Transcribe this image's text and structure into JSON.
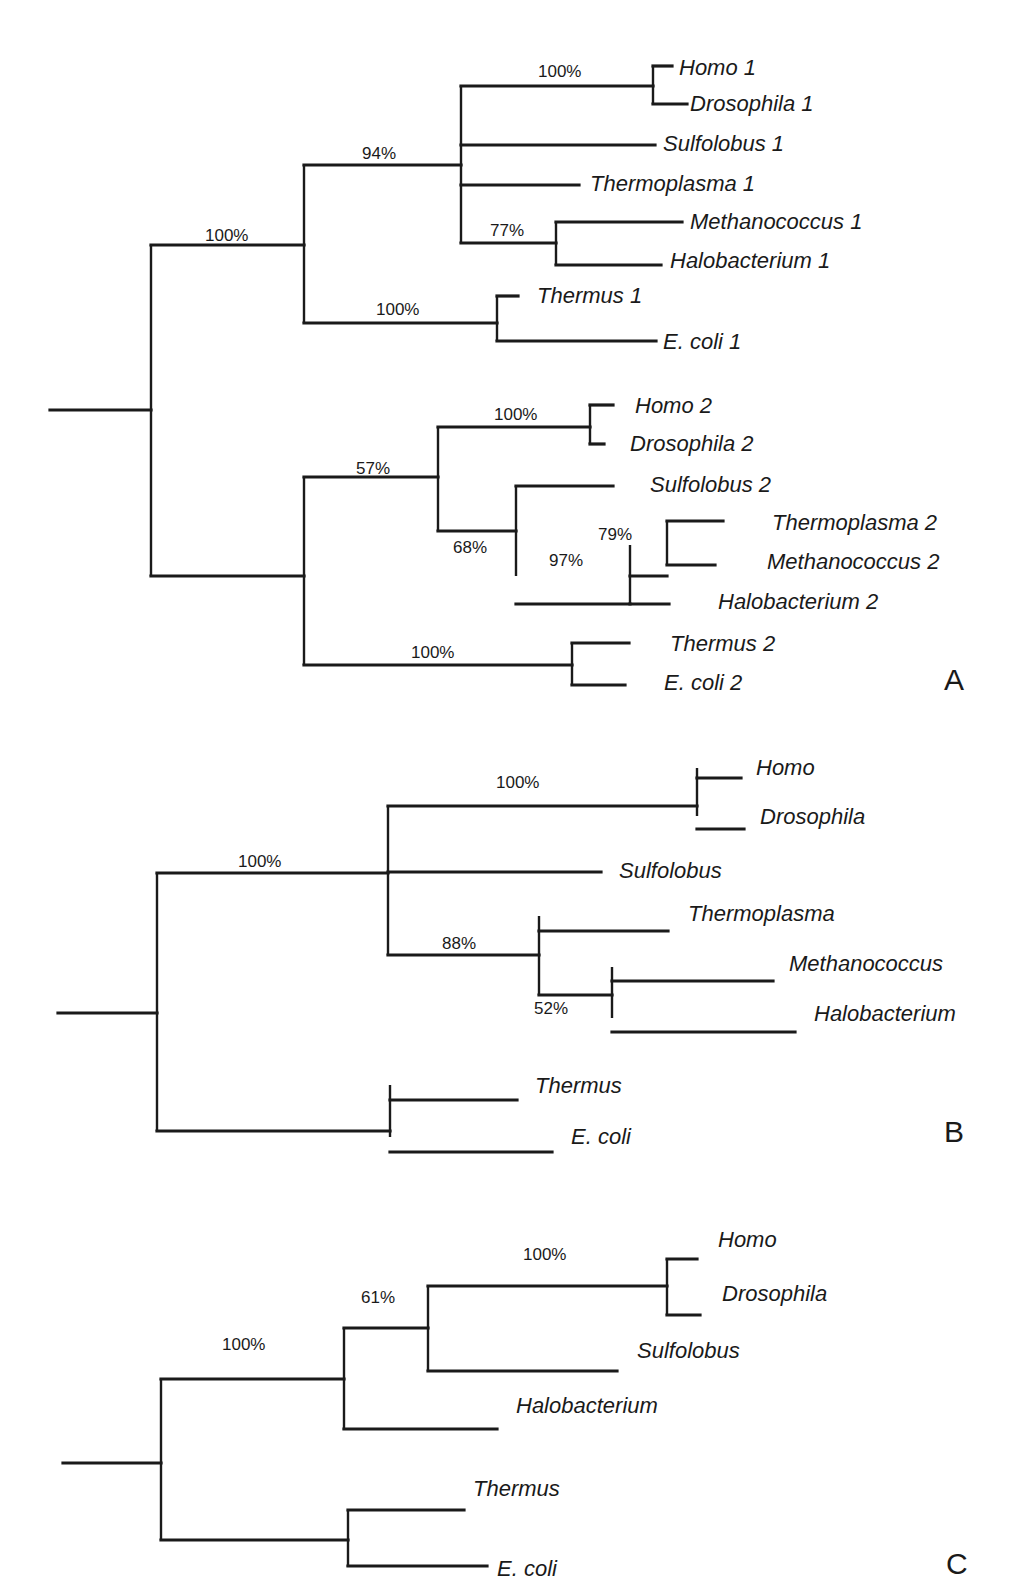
{
  "figure": {
    "panels": [
      {
        "id": "A",
        "letter": "A",
        "letter_pos": [
          944,
          690
        ],
        "vlines": [
          [
            151,
            245,
            576
          ],
          [
            304,
            165,
            323
          ],
          [
            461,
            86,
            243
          ],
          [
            653,
            66,
            104
          ],
          [
            556,
            222,
            265
          ],
          [
            497,
            296,
            341
          ],
          [
            304,
            477,
            665
          ],
          [
            438,
            427,
            531
          ],
          [
            590,
            405,
            444
          ],
          [
            516,
            486,
            576
          ],
          [
            630,
            545,
            604
          ],
          [
            667,
            521,
            565
          ],
          [
            572,
            643,
            685
          ]
        ],
        "hlines": [
          [
            50,
            151,
            410
          ],
          [
            151,
            304,
            245
          ],
          [
            151,
            304,
            576
          ],
          [
            304,
            461,
            165
          ],
          [
            304,
            497,
            323
          ],
          [
            461,
            653,
            86
          ],
          [
            653,
            672,
            66
          ],
          [
            653,
            687,
            104
          ],
          [
            461,
            655,
            145
          ],
          [
            461,
            579,
            185
          ],
          [
            461,
            556,
            243
          ],
          [
            556,
            682,
            222
          ],
          [
            556,
            661,
            265
          ],
          [
            497,
            518,
            296
          ],
          [
            497,
            656,
            341
          ],
          [
            304,
            438,
            477
          ],
          [
            304,
            572,
            665
          ],
          [
            438,
            590,
            427
          ],
          [
            438,
            516,
            531
          ],
          [
            590,
            613,
            405
          ],
          [
            590,
            604,
            444
          ],
          [
            516,
            613,
            486
          ],
          [
            516,
            630,
            604
          ],
          [
            630,
            667,
            576
          ],
          [
            667,
            723,
            521
          ],
          [
            667,
            715,
            565
          ],
          [
            630,
            669,
            604
          ],
          [
            572,
            629,
            643
          ],
          [
            572,
            625,
            685
          ]
        ],
        "taxa": [
          {
            "label": "Homo 1",
            "x": 679,
            "y": 75
          },
          {
            "label": "Drosophila 1",
            "x": 690,
            "y": 111
          },
          {
            "label": "Sulfolobus 1",
            "x": 663,
            "y": 151
          },
          {
            "label": "Thermoplasma 1",
            "x": 590,
            "y": 191
          },
          {
            "label": "Methanococcus 1",
            "x": 690,
            "y": 229
          },
          {
            "label": "Halobacterium 1",
            "x": 670,
            "y": 268
          },
          {
            "label": "Thermus 1",
            "x": 537,
            "y": 303
          },
          {
            "label": "E. coli 1",
            "x": 663,
            "y": 349
          },
          {
            "label": "Homo 2",
            "x": 635,
            "y": 413
          },
          {
            "label": "Drosophila 2",
            "x": 630,
            "y": 451
          },
          {
            "label": "Sulfolobus 2",
            "x": 650,
            "y": 492
          },
          {
            "label": "Thermoplasma 2",
            "x": 772,
            "y": 530
          },
          {
            "label": "Methanococcus 2",
            "x": 767,
            "y": 569
          },
          {
            "label": "Halobacterium 2",
            "x": 718,
            "y": 609
          },
          {
            "label": "Thermus 2",
            "x": 670,
            "y": 651
          },
          {
            "label": "E. coli 2",
            "x": 664,
            "y": 690
          }
        ],
        "supports": [
          {
            "label": "100%",
            "x": 205,
            "y": 241
          },
          {
            "label": "94%",
            "x": 362,
            "y": 159
          },
          {
            "label": "100%",
            "x": 538,
            "y": 77
          },
          {
            "label": "77%",
            "x": 490,
            "y": 236
          },
          {
            "label": "100%",
            "x": 376,
            "y": 315
          },
          {
            "label": "57%",
            "x": 356,
            "y": 474
          },
          {
            "label": "100%",
            "x": 494,
            "y": 420
          },
          {
            "label": "68%",
            "x": 453,
            "y": 553
          },
          {
            "label": "97%",
            "x": 549,
            "y": 566
          },
          {
            "label": "79%",
            "x": 598,
            "y": 540
          },
          {
            "label": "100%",
            "x": 411,
            "y": 658
          }
        ]
      },
      {
        "id": "B",
        "letter": "B",
        "letter_pos": [
          944,
          1142
        ],
        "vlines": [
          [
            157,
            873,
            1131
          ],
          [
            388,
            806,
            955
          ],
          [
            697,
            768,
            816
          ],
          [
            539,
            916,
            995
          ],
          [
            612,
            967,
            1018
          ],
          [
            390,
            1085,
            1137
          ]
        ],
        "hlines": [
          [
            58,
            157,
            1013
          ],
          [
            157,
            388,
            873
          ],
          [
            157,
            390,
            1131
          ],
          [
            388,
            697,
            806
          ],
          [
            697,
            741,
            778
          ],
          [
            697,
            744,
            829
          ],
          [
            388,
            601,
            872
          ],
          [
            388,
            539,
            955
          ],
          [
            539,
            668,
            931
          ],
          [
            539,
            612,
            995
          ],
          [
            612,
            773,
            981
          ],
          [
            612,
            795,
            1032
          ],
          [
            390,
            517,
            1100
          ],
          [
            390,
            552,
            1152
          ]
        ],
        "taxa": [
          {
            "label": "Homo",
            "x": 756,
            "y": 775
          },
          {
            "label": "Drosophila",
            "x": 760,
            "y": 824
          },
          {
            "label": "Sulfolobus",
            "x": 619,
            "y": 878
          },
          {
            "label": "Thermoplasma",
            "x": 688,
            "y": 921
          },
          {
            "label": "Methanococcus",
            "x": 789,
            "y": 971
          },
          {
            "label": "Halobacterium",
            "x": 814,
            "y": 1021
          },
          {
            "label": "Thermus",
            "x": 535,
            "y": 1093
          },
          {
            "label": "E. coli",
            "x": 571,
            "y": 1144
          }
        ],
        "supports": [
          {
            "label": "100%",
            "x": 238,
            "y": 867
          },
          {
            "label": "100%",
            "x": 496,
            "y": 788
          },
          {
            "label": "88%",
            "x": 442,
            "y": 949
          },
          {
            "label": "52%",
            "x": 534,
            "y": 1014
          }
        ]
      },
      {
        "id": "C",
        "letter": "C",
        "letter_pos": [
          946,
          1574
        ],
        "vlines": [
          [
            161,
            1379,
            1540
          ],
          [
            344,
            1328,
            1430
          ],
          [
            428,
            1286,
            1371
          ],
          [
            667,
            1259,
            1315
          ],
          [
            348,
            1510,
            1567
          ]
        ],
        "hlines": [
          [
            63,
            161,
            1463
          ],
          [
            161,
            344,
            1379
          ],
          [
            161,
            348,
            1540
          ],
          [
            344,
            428,
            1328
          ],
          [
            344,
            497,
            1429
          ],
          [
            428,
            667,
            1286
          ],
          [
            667,
            697,
            1259
          ],
          [
            667,
            700,
            1315
          ],
          [
            428,
            617,
            1371
          ],
          [
            348,
            464,
            1510
          ],
          [
            348,
            487,
            1566
          ]
        ],
        "taxa": [
          {
            "label": "Homo",
            "x": 718,
            "y": 1247
          },
          {
            "label": "Drosophila",
            "x": 722,
            "y": 1301
          },
          {
            "label": "Sulfolobus",
            "x": 637,
            "y": 1358
          },
          {
            "label": "Halobacterium",
            "x": 516,
            "y": 1413
          },
          {
            "label": "Thermus",
            "x": 473,
            "y": 1496
          },
          {
            "label": "E. coli",
            "x": 497,
            "y": 1576
          }
        ],
        "supports": [
          {
            "label": "100%",
            "x": 222,
            "y": 1350
          },
          {
            "label": "61%",
            "x": 361,
            "y": 1303
          },
          {
            "label": "100%",
            "x": 523,
            "y": 1260
          }
        ]
      }
    ]
  }
}
